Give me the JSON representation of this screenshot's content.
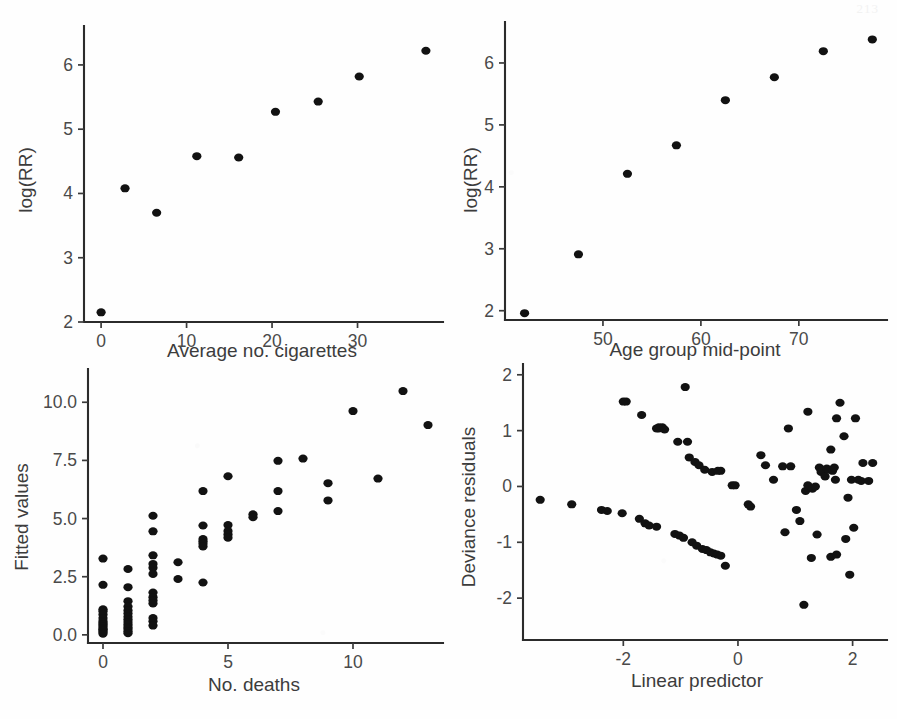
{
  "figure": {
    "page_number": "213",
    "background_color": "#fefefe",
    "point_color": "#121212",
    "axis_color": "#2b2b2b",
    "label_color": "#4a4a4a"
  },
  "chart_data": [
    {
      "id": "log-rr-vs-cigarettes",
      "type": "scatter",
      "title": "",
      "xlabel": "Average no. cigarettes",
      "ylabel": "log(RR)",
      "xlim": [
        -2,
        40
      ],
      "ylim": [
        2,
        6.45
      ],
      "xticks": [
        0,
        10,
        20,
        30
      ],
      "xtick_labels": [
        "0",
        "10",
        "20",
        "30"
      ],
      "yticks": [
        2,
        3,
        4,
        5,
        6
      ],
      "ytick_labels": [
        "2",
        "3",
        "4",
        "5",
        "6"
      ],
      "grid": false,
      "legend": "none",
      "x": [
        0,
        2.8,
        6.5,
        11.2,
        16.1,
        20.4,
        25.4,
        30.2,
        38.0
      ],
      "y": [
        2.15,
        4.08,
        3.7,
        4.58,
        4.56,
        5.27,
        5.43,
        5.82,
        6.22
      ]
    },
    {
      "id": "log-rr-vs-age",
      "type": "scatter",
      "title": "",
      "xlabel": "Age group mid-point",
      "ylabel": "log(RR)",
      "xlim": [
        40,
        79
      ],
      "ylim": [
        1.85,
        6.5
      ],
      "xticks": [
        50,
        60,
        70
      ],
      "xtick_labels": [
        "50",
        "60",
        "70"
      ],
      "yticks": [
        2,
        3,
        4,
        5,
        6
      ],
      "ytick_labels": [
        "2",
        "3",
        "4",
        "5",
        "6"
      ],
      "grid": false,
      "legend": "none",
      "x": [
        42.0,
        47.5,
        52.5,
        57.5,
        62.5,
        67.5,
        72.5,
        77.5
      ],
      "y": [
        1.96,
        2.91,
        4.21,
        4.67,
        5.4,
        5.77,
        6.19,
        6.38
      ]
    },
    {
      "id": "fitted-vs-deaths",
      "type": "scatter",
      "title": "",
      "xlabel": "No. deaths",
      "ylabel": "Fitted values",
      "xlim": [
        -0.6,
        13.6
      ],
      "ylim": [
        -0.35,
        11.0
      ],
      "xticks": [
        0,
        5,
        10
      ],
      "xtick_labels": [
        "0",
        "5",
        "10"
      ],
      "yticks": [
        0.0,
        2.5,
        5.0,
        7.5,
        10.0
      ],
      "ytick_labels": [
        "0.0",
        "2.5",
        "5.0",
        "7.5",
        "10.0"
      ],
      "grid": false,
      "legend": "none",
      "x": [
        0,
        0,
        0,
        0,
        0,
        0,
        0,
        0,
        0,
        0,
        0,
        0,
        0,
        0,
        0,
        1,
        1,
        1,
        1,
        1,
        1,
        1,
        1,
        1,
        1,
        1,
        1,
        1,
        1,
        2,
        2,
        2,
        2,
        2,
        2,
        2,
        2,
        2,
        2,
        2,
        2,
        2,
        3,
        3,
        4,
        4,
        4,
        4,
        4,
        4,
        4,
        5,
        5,
        5,
        5,
        5,
        6,
        6,
        7,
        7,
        7,
        8,
        9,
        9,
        10,
        11,
        12,
        13
      ],
      "y": [
        3.28,
        2.15,
        1.1,
        1.02,
        0.88,
        0.72,
        0.6,
        0.52,
        0.45,
        0.38,
        0.3,
        0.24,
        0.18,
        0.12,
        0.05,
        2.83,
        2.05,
        1.45,
        1.22,
        1.05,
        0.92,
        0.78,
        0.66,
        0.55,
        0.44,
        0.34,
        0.26,
        0.16,
        0.07,
        5.12,
        4.45,
        3.42,
        3.05,
        2.88,
        2.62,
        1.82,
        1.62,
        1.48,
        1.35,
        0.72,
        0.58,
        0.4,
        3.12,
        2.4,
        6.18,
        4.7,
        4.12,
        4.02,
        3.92,
        3.8,
        2.25,
        6.82,
        4.72,
        4.46,
        4.32,
        4.18,
        5.18,
        5.06,
        7.48,
        6.18,
        5.32,
        7.58,
        6.52,
        5.78,
        9.62,
        6.72,
        10.48,
        9.02
      ]
    },
    {
      "id": "deviance-residuals-vs-linear-predictor",
      "type": "scatter",
      "title": "",
      "xlabel": "Linear predictor",
      "ylabel": "Deviance residuals",
      "xlim": [
        -3.75,
        2.6
      ],
      "ylim": [
        -2.75,
        2.05
      ],
      "xticks": [
        -2,
        0,
        2
      ],
      "xtick_labels": [
        "-2",
        "0",
        "2"
      ],
      "yticks": [
        -2,
        -1,
        0,
        1,
        2
      ],
      "ytick_labels": [
        "-2",
        "-1",
        "0",
        "1",
        "2"
      ],
      "grid": false,
      "legend": "none",
      "x": [
        -3.45,
        -2.9,
        -2.38,
        -2.28,
        -2.02,
        -1.95,
        -1.72,
        -1.62,
        -1.55,
        -1.42,
        -1.38,
        -1.32,
        -1.1,
        -1.02,
        -0.95,
        -0.88,
        -0.8,
        -0.72,
        -0.62,
        -0.55,
        -0.48,
        -0.42,
        -0.36,
        -0.3,
        -0.22,
        -0.1,
        -2.0,
        -1.68,
        -1.42,
        -1.38,
        -1.28,
        -1.05,
        -0.85,
        -0.75,
        -0.68,
        -0.58,
        -0.45,
        -0.3,
        -0.05,
        -0.92,
        -0.35,
        0.18,
        0.22,
        0.4,
        0.48,
        0.62,
        0.78,
        0.88,
        0.82,
        1.02,
        1.08,
        1.18,
        1.22,
        1.3,
        1.35,
        1.42,
        1.45,
        1.48,
        1.52,
        1.55,
        1.58,
        1.62,
        1.65,
        1.68,
        1.7,
        1.72,
        1.78,
        1.85,
        1.92,
        1.98,
        2.02,
        2.05,
        2.1,
        2.18,
        2.28,
        2.35,
        1.28,
        1.62,
        1.72,
        1.15,
        0.92,
        1.22,
        1.38,
        1.88,
        2.15,
        1.95
      ],
      "y": [
        -0.24,
        -0.32,
        -0.42,
        -0.44,
        -0.48,
        1.52,
        -0.58,
        -0.66,
        -0.7,
        -0.72,
        1.04,
        1.06,
        -0.85,
        -0.88,
        -0.92,
        0.8,
        -1.0,
        -1.06,
        -1.12,
        -1.14,
        -1.18,
        -1.2,
        -1.22,
        -1.24,
        -1.42,
        0.02,
        1.52,
        1.28,
        1.04,
        1.06,
        1.02,
        0.8,
        0.52,
        0.44,
        0.38,
        0.3,
        0.26,
        0.28,
        0.02,
        1.78,
        0.28,
        -0.32,
        -0.36,
        0.56,
        0.38,
        0.12,
        0.36,
        1.04,
        -0.82,
        -0.42,
        -0.62,
        -0.08,
        0.02,
        -0.04,
        0.0,
        0.34,
        0.26,
        0.3,
        0.18,
        0.32,
        0.3,
        0.66,
        0.28,
        0.34,
        0.12,
        1.22,
        1.5,
        0.9,
        -0.2,
        0.12,
        -0.74,
        1.22,
        0.12,
        0.42,
        0.1,
        0.42,
        -1.28,
        -1.26,
        -1.22,
        -2.12,
        0.36,
        1.34,
        -0.86,
        -0.94,
        0.1,
        -1.58
      ]
    }
  ]
}
